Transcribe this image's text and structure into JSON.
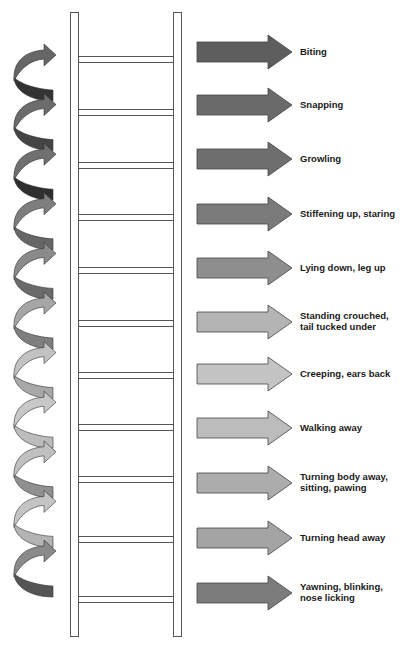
{
  "steps": [
    {
      "lines": [
        "Biting"
      ],
      "arrow_color": "#5e5e5e"
    },
    {
      "lines": [
        "Snapping"
      ],
      "arrow_color": "#6a6a6a"
    },
    {
      "lines": [
        "Growling"
      ],
      "arrow_color": "#6e6e6e"
    },
    {
      "lines": [
        "Stiffening up, staring"
      ],
      "arrow_color": "#7a7a7a"
    },
    {
      "lines": [
        "Lying down, leg up"
      ],
      "arrow_color": "#8e8e8e"
    },
    {
      "lines": [
        "Standing crouched,",
        "tail tucked under"
      ],
      "arrow_color": "#b4b4b4"
    },
    {
      "lines": [
        "Creeping, ears back"
      ],
      "arrow_color": "#c4c4c4"
    },
    {
      "lines": [
        "Walking away"
      ],
      "arrow_color": "#bcbcbc"
    },
    {
      "lines": [
        "Turning body away,",
        "sitting, pawing"
      ],
      "arrow_color": "#acacac"
    },
    {
      "lines": [
        "Turning head away"
      ],
      "arrow_color": "#a4a4a4"
    },
    {
      "lines": [
        "Yawning, blinking,",
        "nose licking"
      ],
      "arrow_color": "#7c7c7c"
    }
  ],
  "curved_arrows": [
    {
      "top_color": "#666666",
      "bottom_color": "#333333"
    },
    {
      "top_color": "#6c6c6c",
      "bottom_color": "#444444"
    },
    {
      "top_color": "#707070",
      "bottom_color": "#2e2e2e"
    },
    {
      "top_color": "#7e7e7e",
      "bottom_color": "#666666"
    },
    {
      "top_color": "#8a8a8a",
      "bottom_color": "#6a6a6a"
    },
    {
      "top_color": "#a6a6a6",
      "bottom_color": "#7e7e7e"
    },
    {
      "top_color": "#c2c2c2",
      "bottom_color": "#a8a8a8"
    },
    {
      "top_color": "#c8c8c8",
      "bottom_color": "#bcbcbc"
    },
    {
      "top_color": "#c0c0c0",
      "bottom_color": "#909090"
    },
    {
      "top_color": "#c4c4c4",
      "bottom_color": "#b4b4b4"
    },
    {
      "top_color": "#8a8a8a",
      "bottom_color": "#555555"
    }
  ],
  "ladder_rungs": 11
}
